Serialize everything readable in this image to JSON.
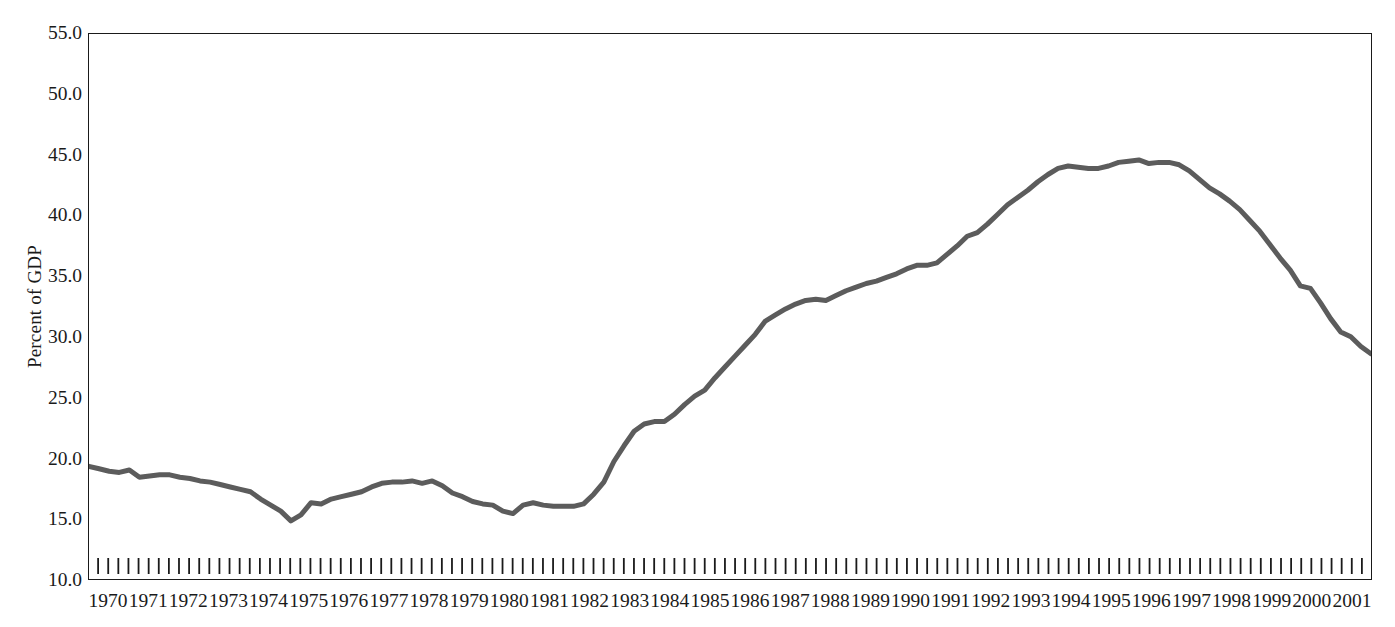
{
  "chart_data": {
    "type": "line",
    "title": "",
    "subtitle": "",
    "xlabel": "",
    "ylabel": "Percent of GDP",
    "ylim": [
      10.0,
      55.0
    ],
    "ytick_labels": [
      "55.0",
      "50.0",
      "45.0",
      "40.0",
      "35.0",
      "30.0",
      "25.0",
      "20.0",
      "15.0",
      "10.0"
    ],
    "ytick_values": [
      55.0,
      50.0,
      45.0,
      40.0,
      35.0,
      30.0,
      25.0,
      20.0,
      15.0,
      10.0
    ],
    "grid": false,
    "legend": "none",
    "line_color": "#5c5c5c",
    "line_width_px": 5,
    "axis_color": "#1a1a1a",
    "x_minor_ticks": "quarterly",
    "xlim": [
      1970.0,
      2001.75
    ],
    "categories": [
      "1970",
      "1971",
      "1972",
      "1973",
      "1974",
      "1975",
      "1976",
      "1977",
      "1978",
      "1979",
      "1980",
      "1981",
      "1982",
      "1983",
      "1984",
      "1985",
      "1986",
      "1987",
      "1988",
      "1989",
      "1990",
      "1991",
      "1992",
      "1993",
      "1994",
      "1995",
      "1996",
      "1997",
      "1998",
      "1999",
      "2000",
      "2001"
    ],
    "series": [
      {
        "name": "Percent of GDP",
        "x": [
          1970.0,
          1970.25,
          1970.5,
          1970.75,
          1971.0,
          1971.25,
          1971.5,
          1971.75,
          1972.0,
          1972.25,
          1972.5,
          1972.75,
          1973.0,
          1973.25,
          1973.5,
          1973.75,
          1974.0,
          1974.25,
          1974.5,
          1974.75,
          1975.0,
          1975.25,
          1975.5,
          1975.75,
          1976.0,
          1976.25,
          1976.5,
          1976.75,
          1977.0,
          1977.25,
          1977.5,
          1977.75,
          1978.0,
          1978.25,
          1978.5,
          1978.75,
          1979.0,
          1979.25,
          1979.5,
          1979.75,
          1980.0,
          1980.25,
          1980.5,
          1980.75,
          1981.0,
          1981.25,
          1981.5,
          1981.75,
          1982.0,
          1982.25,
          1982.5,
          1982.75,
          1983.0,
          1983.25,
          1983.5,
          1983.75,
          1984.0,
          1984.25,
          1984.5,
          1984.75,
          1985.0,
          1985.25,
          1985.5,
          1985.75,
          1986.0,
          1986.25,
          1986.5,
          1986.75,
          1987.0,
          1987.25,
          1987.5,
          1987.75,
          1988.0,
          1988.25,
          1988.5,
          1988.75,
          1989.0,
          1989.25,
          1989.5,
          1989.75,
          1990.0,
          1990.25,
          1990.5,
          1990.75,
          1991.0,
          1991.25,
          1991.5,
          1991.75,
          1992.0,
          1992.25,
          1992.5,
          1992.75,
          1993.0,
          1993.25,
          1993.5,
          1993.75,
          1994.0,
          1994.25,
          1994.5,
          1994.75,
          1995.0,
          1995.25,
          1995.5,
          1995.75,
          1996.0,
          1996.25,
          1996.5,
          1996.75,
          1997.0,
          1997.25,
          1997.5,
          1997.75,
          1998.0,
          1998.25,
          1998.5,
          1998.75,
          1999.0,
          1999.25,
          1999.5,
          1999.75,
          2000.0,
          2000.25,
          2000.5,
          2000.75,
          2001.0,
          2001.25,
          2001.5,
          2001.75
        ],
        "values": [
          19.3,
          19.1,
          18.9,
          18.8,
          19.0,
          18.4,
          18.5,
          18.6,
          18.6,
          18.4,
          18.3,
          18.1,
          18.0,
          17.8,
          17.6,
          17.4,
          17.2,
          16.6,
          16.1,
          15.6,
          14.8,
          15.3,
          16.3,
          16.2,
          16.6,
          16.8,
          17.0,
          17.2,
          17.6,
          17.9,
          18.0,
          18.0,
          18.1,
          17.9,
          18.1,
          17.7,
          17.1,
          16.8,
          16.4,
          16.2,
          16.1,
          15.6,
          15.4,
          16.1,
          16.3,
          16.1,
          16.0,
          16.0,
          16.0,
          16.2,
          17.0,
          18.0,
          19.7,
          21.0,
          22.2,
          22.8,
          23.0,
          23.0,
          23.6,
          24.4,
          25.1,
          25.6,
          26.6,
          27.5,
          28.4,
          29.3,
          30.2,
          31.3,
          31.8,
          32.3,
          32.7,
          33.0,
          33.1,
          33.0,
          33.4,
          33.8,
          34.1,
          34.4,
          34.6,
          34.9,
          35.2,
          35.6,
          35.9,
          35.9,
          36.1,
          36.8,
          37.5,
          38.3,
          38.6,
          39.3,
          40.1,
          40.9,
          41.5,
          42.1,
          42.8,
          43.4,
          43.9,
          44.1,
          44.0,
          43.9,
          43.9,
          44.1,
          44.4,
          44.5,
          44.6,
          44.3,
          44.4,
          44.4,
          44.2,
          43.7,
          43.0,
          42.3,
          41.8,
          41.2,
          40.5,
          39.6,
          38.7,
          37.6,
          36.5,
          35.5,
          34.2,
          34.0,
          32.8,
          31.5,
          30.4,
          30.0,
          29.2,
          28.6
        ]
      }
    ]
  }
}
